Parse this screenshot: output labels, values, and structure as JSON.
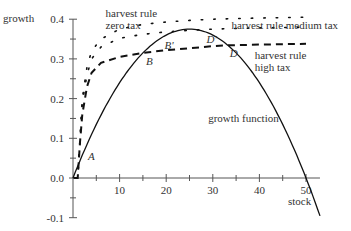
{
  "chart_data": {
    "type": "line",
    "title": "",
    "xlabel": "stock",
    "ylabel": "growth",
    "xlim": [
      0,
      53
    ],
    "ylim": [
      -0.1,
      0.4
    ],
    "xticks": [
      10,
      20,
      30,
      40,
      50
    ],
    "xticks_minor": [
      5,
      15,
      25,
      35,
      45
    ],
    "yticks": [
      -0.1,
      0.0,
      0.1,
      0.2,
      0.3,
      0.4
    ],
    "yticks_minor": [
      -0.05,
      0.05,
      0.15,
      0.25,
      0.35
    ],
    "ytick_labels": [
      "-0.1",
      "0.0",
      "0.1",
      "0.2",
      "0.3",
      "0.4"
    ],
    "xtick_labels": [
      "10",
      "20",
      "30",
      "40",
      "50"
    ],
    "grid": false,
    "legend": "none (inline annotations)",
    "series": [
      {
        "name": "growth function",
        "style": "solid",
        "formula": "0.03*S*(1-S/50)",
        "x": [
          0,
          5,
          10,
          15,
          20,
          25,
          30,
          35,
          40,
          45,
          50,
          53
        ],
        "y": [
          0,
          0.135,
          0.24,
          0.315,
          0.36,
          0.375,
          0.36,
          0.315,
          0.24,
          0.135,
          0,
          -0.095
        ]
      },
      {
        "name": "harvest rule zero tax",
        "style": "dotted",
        "x": [
          1,
          2,
          3,
          4,
          6,
          10,
          15,
          20,
          25,
          30,
          40,
          50
        ],
        "y": [
          0.0,
          0.2,
          0.28,
          0.32,
          0.35,
          0.375,
          0.387,
          0.393,
          0.397,
          0.4,
          0.403,
          0.405
        ]
      },
      {
        "name": "harvest rule medium tax",
        "style": "dotted",
        "x": [
          1,
          2,
          3,
          4,
          6,
          10,
          15,
          20,
          25,
          30,
          40,
          50
        ],
        "y": [
          0.0,
          0.19,
          0.26,
          0.3,
          0.33,
          0.352,
          0.362,
          0.368,
          0.372,
          0.375,
          0.378,
          0.38
        ]
      },
      {
        "name": "harvest rule high tax",
        "style": "dashed",
        "x": [
          1,
          1.5,
          2,
          3,
          4,
          6,
          10,
          15,
          20,
          25,
          30,
          33,
          40,
          50
        ],
        "y": [
          0.0,
          0.09,
          0.16,
          0.23,
          0.265,
          0.29,
          0.305,
          0.315,
          0.322,
          0.327,
          0.332,
          0.334,
          0.336,
          0.338
        ]
      }
    ],
    "points": [
      {
        "label": "A",
        "x": 2.6,
        "y": 0.075
      },
      {
        "label": "B",
        "x": 15,
        "y": 0.315
      },
      {
        "label": "B'",
        "x": 19,
        "y": 0.355
      },
      {
        "label": "D'",
        "x": 28,
        "y": 0.37
      },
      {
        "label": "D",
        "x": 33,
        "y": 0.334
      }
    ],
    "annotations": [
      {
        "text": "harvest rule",
        "x": 7,
        "y": 0.405
      },
      {
        "text": "zero tax",
        "x": 7,
        "y": 0.375
      },
      {
        "text": "harvest rule medium tax",
        "x": 34,
        "y": 0.375
      },
      {
        "text": "harvest rule",
        "x": 39,
        "y": 0.3
      },
      {
        "text": "high tax",
        "x": 39,
        "y": 0.27
      },
      {
        "text": "growth function",
        "x": 29,
        "y": 0.14
      }
    ]
  }
}
